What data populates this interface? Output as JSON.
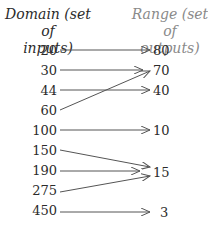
{
  "diagram": {
    "domain_header": "Domain (set of inputs)",
    "domain_header_lines": [
      "Domain (set of",
      "inputs)"
    ],
    "range_header": "Range (set of outputs)",
    "range_header_lines": [
      "Range (set of",
      "outputs)"
    ],
    "colors": {
      "text": "#2b2b2b",
      "range_header": "#8a8a8a",
      "arrow": "#555555"
    },
    "domain": [
      "20",
      "30",
      "44",
      "60",
      "100",
      "150",
      "190",
      "275",
      "450"
    ],
    "range": [
      "80",
      "70",
      "40",
      "10",
      "15",
      "3"
    ],
    "mappings": [
      {
        "from": "20",
        "to": "80"
      },
      {
        "from": "30",
        "to": "70"
      },
      {
        "from": "44",
        "to": "40"
      },
      {
        "from": "60",
        "to": "70"
      },
      {
        "from": "100",
        "to": "10"
      },
      {
        "from": "150",
        "to": "15"
      },
      {
        "from": "190",
        "to": "15"
      },
      {
        "from": "275",
        "to": "15"
      },
      {
        "from": "450",
        "to": "3"
      }
    ]
  }
}
